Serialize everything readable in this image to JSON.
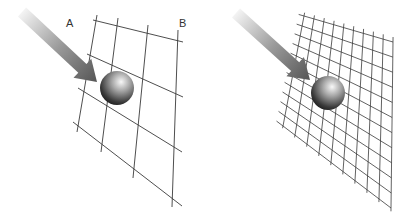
{
  "panels": [
    {
      "id": "left",
      "description": "coarse grid with sphere and incoming arrow",
      "labels": [
        {
          "text": "A",
          "x": 68,
          "y": 26
        },
        {
          "text": "B",
          "x": 180,
          "y": 25
        }
      ],
      "grid": {
        "horizontal": [
          [
            93,
            20,
            183,
            42
          ],
          [
            87,
            54,
            183,
            97
          ],
          [
            78,
            88,
            182,
            152
          ],
          [
            73,
            122,
            182,
            206
          ]
        ],
        "vertical": [
          [
            97,
            15,
            77,
            132
          ],
          [
            118,
            18,
            101,
            152
          ],
          [
            148,
            25,
            133,
            178
          ],
          [
            178,
            30,
            172,
            207
          ]
        ]
      },
      "sphere": {
        "cx": 117,
        "cy": 88,
        "r": 17
      },
      "arrow": {
        "x1": 22,
        "y1": 12,
        "x2": 97,
        "y2": 82
      }
    },
    {
      "id": "right",
      "description": "fine grid with sphere and incoming arrow",
      "labels": [],
      "grid": {
        "top_left": [
          304,
          16
        ],
        "top_right": [
          393,
          42
        ],
        "bottom_left": [
          283,
          126
        ],
        "bottom_right": [
          391,
          208
        ],
        "cols": 10,
        "rows": 12
      },
      "sphere": {
        "cx": 328,
        "cy": 93,
        "r": 17
      },
      "arrow": {
        "x1": 236,
        "y1": 13,
        "x2": 310,
        "y2": 80
      }
    }
  ],
  "colors": {
    "grid_line": "#3a3a3a",
    "arrow_start": "#f2f2f2",
    "arrow_end": "#5a5a5a",
    "sphere_light": "#f4f4f4",
    "sphere_mid": "#8a8a8a",
    "sphere_dark": "#1e1e1e",
    "label": "#333333"
  }
}
